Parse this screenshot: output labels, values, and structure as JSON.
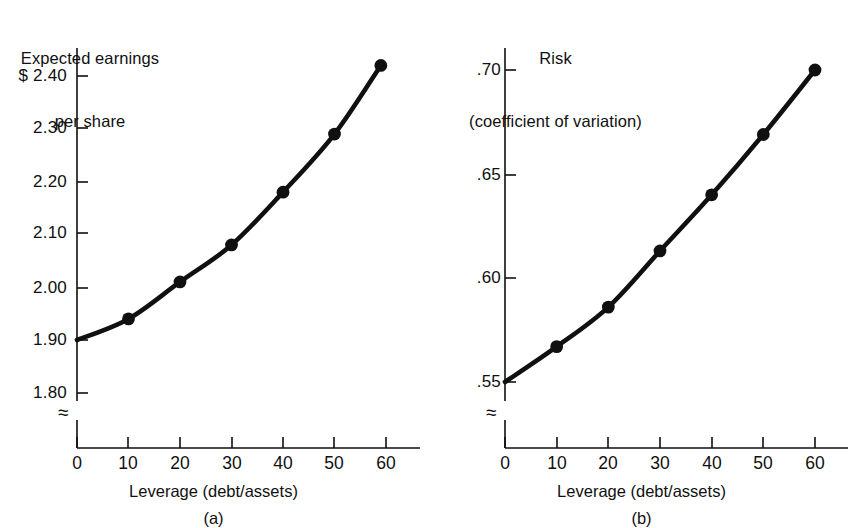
{
  "figure": {
    "background_color": "#ffffff",
    "ink_color": "#101010"
  },
  "chart_data": [
    {
      "type": "line",
      "panel": "(a)",
      "title": "Expected earnings\nper share",
      "ylabel": "Expected earnings per share",
      "xlabel": "Leverage (debt/assets)",
      "x": [
        0,
        10,
        20,
        30,
        40,
        50,
        59
      ],
      "values": [
        1.9,
        1.94,
        2.01,
        2.08,
        2.18,
        2.29,
        2.42
      ],
      "marker_x": [
        10,
        20,
        30,
        40,
        50,
        59
      ],
      "marker_values": [
        1.94,
        2.01,
        2.08,
        2.18,
        2.29,
        2.42
      ],
      "ylim": [
        1.8,
        2.45
      ],
      "xlim": [
        0,
        68
      ],
      "ytick_labels": [
        "$ 2.40",
        "2.30",
        "2.20",
        "2.10",
        "2.00",
        "1.90",
        "1.80"
      ],
      "ytick_values": [
        2.4,
        2.3,
        2.2,
        2.1,
        2.0,
        1.9,
        1.8
      ],
      "xtick_labels": [
        "0",
        "10",
        "20",
        "30",
        "40",
        "50",
        "60"
      ],
      "xtick_values": [
        0,
        10,
        20,
        30,
        40,
        50,
        60
      ],
      "axis_break": "≈",
      "grid": false,
      "legend": "none",
      "marker": "filled-circle",
      "line_color": "#101010"
    },
    {
      "type": "line",
      "panel": "(b)",
      "title": "Risk\n(coefficient of variation)",
      "ylabel": "Risk (coefficient of variation)",
      "xlabel": "Leverage (debt/assets)",
      "x": [
        0,
        10,
        20,
        30,
        40,
        50,
        60
      ],
      "values": [
        0.55,
        0.567,
        0.586,
        0.613,
        0.64,
        0.669,
        0.7
      ],
      "marker_x": [
        10,
        20,
        30,
        40,
        50,
        60
      ],
      "marker_values": [
        0.567,
        0.586,
        0.613,
        0.64,
        0.669,
        0.7
      ],
      "ylim": [
        0.545,
        0.715
      ],
      "xlim": [
        0,
        68
      ],
      "ytick_labels": [
        ".70",
        ".65",
        ".60",
        ".55"
      ],
      "ytick_values": [
        0.7,
        0.65,
        0.6,
        0.55
      ],
      "xtick_labels": [
        "0",
        "10",
        "20",
        "30",
        "40",
        "50",
        "60"
      ],
      "xtick_values": [
        0,
        10,
        20,
        30,
        40,
        50,
        60
      ],
      "axis_break": "≈",
      "grid": false,
      "legend": "none",
      "marker": "filled-circle",
      "line_color": "#101010"
    }
  ],
  "panel_a": {
    "title_line1": "Expected earnings",
    "title_line2": "per share",
    "ytick_labels": [
      "$ 2.40",
      "2.30",
      "2.20",
      "2.10",
      "2.00",
      "1.90",
      "1.80"
    ],
    "xtick_labels": [
      "0",
      "10",
      "20",
      "30",
      "40",
      "50",
      "60"
    ],
    "xaxis_caption": "Leverage (debt/assets)",
    "panel_letter": "(a)",
    "break_symbol": "≈"
  },
  "panel_b": {
    "title_line1": "Risk",
    "title_line2": "(coefficient of variation)",
    "ytick_labels": [
      ".70",
      ".65",
      ".60",
      ".55"
    ],
    "xtick_labels": [
      "0",
      "10",
      "20",
      "30",
      "40",
      "50",
      "60"
    ],
    "xaxis_caption": "Leverage (debt/assets)",
    "panel_letter": "(b)",
    "break_symbol": "≈"
  }
}
